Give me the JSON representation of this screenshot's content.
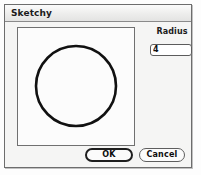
{
  "window": {
    "title": "Sketchy"
  },
  "canvas": {
    "name": "sketch-preview",
    "shape": "circle",
    "stroke_color": "#111111",
    "fill_color": "#fcfcfc",
    "stroke_width": 2.6,
    "center_x": 58,
    "center_y": 58,
    "radius": 40
  },
  "radius_control": {
    "label": "Radius",
    "value": "4",
    "placeholder": "4"
  },
  "buttons": {
    "ok_label": "OK",
    "cancel_label": "Cancel"
  }
}
